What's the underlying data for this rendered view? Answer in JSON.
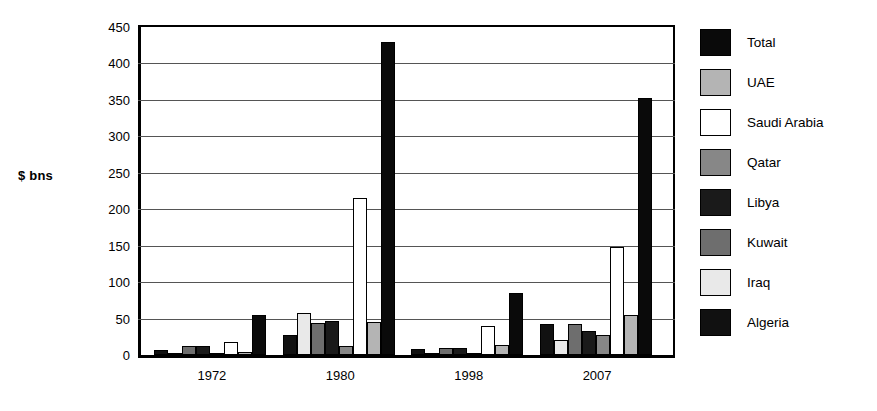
{
  "chart_data": {
    "type": "bar",
    "title": "",
    "xlabel": "",
    "ylabel": "$ bns",
    "ylim": [
      0,
      450
    ],
    "ytick_step": 50,
    "yticks": [
      "450",
      "400",
      "350",
      "300",
      "250",
      "200",
      "150",
      "100",
      "50",
      "0"
    ],
    "grid": true,
    "legend_position": "right",
    "categories": [
      "1972",
      "1980",
      "1998",
      "2007"
    ],
    "series": [
      {
        "name": "Algeria",
        "key": "algeria",
        "color": "#111111",
        "values": [
          7,
          27,
          8,
          43
        ]
      },
      {
        "name": "Iraq",
        "key": "iraq",
        "color": "#e9e9e9",
        "values": [
          2,
          57,
          3,
          20
        ]
      },
      {
        "name": "Kuwait",
        "key": "kuwait",
        "color": "#6e6e6e",
        "values": [
          12,
          44,
          10,
          43
        ]
      },
      {
        "name": "Libya",
        "key": "libya",
        "color": "#1a1a1a",
        "values": [
          13,
          47,
          9,
          33
        ]
      },
      {
        "name": "Qatar",
        "key": "qatar",
        "color": "#878787",
        "values": [
          3,
          12,
          2,
          28
        ]
      },
      {
        "name": "Saudi Arabia",
        "key": "saudi",
        "color": "#ffffff",
        "values": [
          18,
          215,
          40,
          148
        ]
      },
      {
        "name": "UAE",
        "key": "uae",
        "color": "#b4b4b4",
        "values": [
          4,
          45,
          14,
          55
        ]
      },
      {
        "name": "Total",
        "key": "total",
        "color": "#0a0a0a",
        "values": [
          55,
          430,
          85,
          353
        ]
      }
    ],
    "legend_entries": [
      "Total",
      "UAE",
      "Saudi Arabia",
      "Qatar",
      "Libya",
      "Kuwait",
      "Iraq",
      "Algeria"
    ]
  }
}
